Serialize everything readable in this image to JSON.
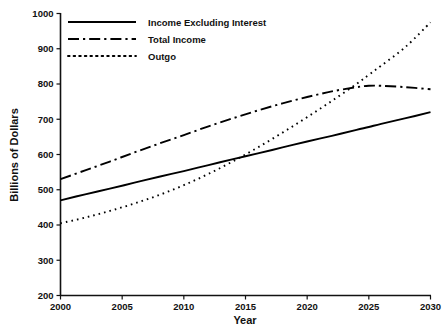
{
  "chart_data": {
    "type": "line",
    "title": "",
    "xlabel": "Year",
    "ylabel": "Billions of Dollars",
    "xlim": [
      2000,
      2030
    ],
    "ylim": [
      200,
      1000
    ],
    "grid": false,
    "legend_position": "top-left",
    "xticks": [
      2000,
      2005,
      2010,
      2015,
      2020,
      2025,
      2030
    ],
    "xtick_labels": [
      "2000",
      "2005",
      "2010",
      "2015",
      "2020",
      "2025",
      "2030"
    ],
    "yticks": [
      200,
      300,
      400,
      500,
      600,
      700,
      800,
      900,
      1000
    ],
    "ytick_labels": [
      "200",
      "300",
      "400",
      "500",
      "600",
      "700",
      "800",
      "900",
      "1000"
    ],
    "x": [
      2000,
      2002,
      2004,
      2006,
      2008,
      2010,
      2012,
      2014,
      2016,
      2018,
      2020,
      2022,
      2024,
      2025,
      2026,
      2028,
      2030
    ],
    "series": [
      {
        "name": "Income Excluding Interest",
        "style": "solid",
        "color": "#000000",
        "values": [
          470,
          487,
          503,
          520,
          537,
          553,
          570,
          587,
          603,
          620,
          637,
          653,
          670,
          678,
          687,
          703,
          720
        ]
      },
      {
        "name": "Total Income",
        "style": "dash-dot",
        "color": "#000000",
        "values": [
          530,
          555,
          580,
          606,
          631,
          655,
          680,
          703,
          725,
          745,
          763,
          779,
          791,
          795,
          795,
          791,
          785
        ]
      },
      {
        "name": "Outgo",
        "style": "dotted",
        "color": "#000000",
        "values": [
          405,
          421,
          440,
          461,
          485,
          513,
          545,
          581,
          620,
          662,
          706,
          752,
          800,
          826,
          852,
          906,
          975
        ]
      }
    ],
    "annotations": []
  },
  "legend": {
    "items": [
      {
        "label": "Income Excluding Interest",
        "style": "solid"
      },
      {
        "label": "Total Income",
        "style": "dash-dot"
      },
      {
        "label": "Outgo",
        "style": "dotted"
      }
    ]
  },
  "axes": {
    "x_title": "Year",
    "y_title": "Billions of Dollars"
  }
}
